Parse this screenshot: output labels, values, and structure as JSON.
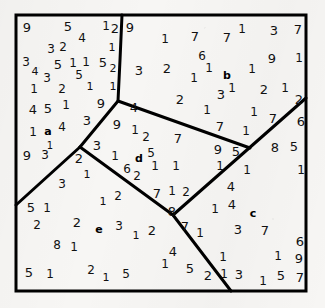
{
  "figure": {
    "width": 325,
    "height": 308,
    "background_color": "#f7f6f4",
    "ink_color": "#111111",
    "border_color": "#000000",
    "border_width": 3,
    "divider_width": 3
  },
  "square": {
    "left": 16,
    "top": 15,
    "right": 306,
    "bottom": 291
  },
  "regions": [
    {
      "id": "a",
      "label": "a",
      "x": 48,
      "y": 131,
      "font_size": 11
    },
    {
      "id": "b",
      "label": "b",
      "x": 227,
      "y": 75,
      "font_size": 11
    },
    {
      "id": "c",
      "label": "c",
      "x": 253,
      "y": 213,
      "font_size": 11
    },
    {
      "id": "d",
      "label": "d",
      "x": 139,
      "y": 158,
      "font_size": 11
    },
    {
      "id": "e",
      "label": "e",
      "x": 99,
      "y": 229,
      "font_size": 11
    }
  ],
  "dividers": [
    {
      "name": "divider-a-b",
      "points": "122,15 120,60 118,101 80,147"
    },
    {
      "name": "divider-a-e",
      "points": "80,147 16,205"
    },
    {
      "name": "divider-d-e",
      "points": "80,147 173,215 231,291"
    },
    {
      "name": "divider-b-d",
      "points": "118,101 250,148"
    },
    {
      "name": "divider-c-left",
      "points": "173,215 306,98"
    }
  ],
  "digits": [
    {
      "v": "9",
      "x": 27,
      "y": 27,
      "s": 13
    },
    {
      "v": "5",
      "x": 68,
      "y": 26,
      "s": 13
    },
    {
      "v": "4",
      "x": 82,
      "y": 38,
      "s": 12
    },
    {
      "v": "1",
      "x": 106,
      "y": 26,
      "s": 12
    },
    {
      "v": "2",
      "x": 115,
      "y": 28,
      "s": 13
    },
    {
      "v": "3",
      "x": 51,
      "y": 49,
      "s": 12
    },
    {
      "v": "2",
      "x": 63,
      "y": 47,
      "s": 12
    },
    {
      "v": "1",
      "x": 112,
      "y": 47,
      "s": 11
    },
    {
      "v": "3",
      "x": 26,
      "y": 62,
      "s": 12
    },
    {
      "v": "4",
      "x": 35,
      "y": 71,
      "s": 11
    },
    {
      "v": "5",
      "x": 58,
      "y": 64,
      "s": 13
    },
    {
      "v": "1",
      "x": 73,
      "y": 63,
      "s": 12
    },
    {
      "v": "1",
      "x": 86,
      "y": 62,
      "s": 12
    },
    {
      "v": "5",
      "x": 103,
      "y": 62,
      "s": 13
    },
    {
      "v": "2",
      "x": 113,
      "y": 68,
      "s": 11
    },
    {
      "v": "3",
      "x": 47,
      "y": 78,
      "s": 12
    },
    {
      "v": "5",
      "x": 79,
      "y": 75,
      "s": 12
    },
    {
      "v": "1",
      "x": 34,
      "y": 89,
      "s": 12
    },
    {
      "v": "2",
      "x": 62,
      "y": 89,
      "s": 12
    },
    {
      "v": "1",
      "x": 90,
      "y": 86,
      "s": 11
    },
    {
      "v": "1",
      "x": 113,
      "y": 86,
      "s": 11
    },
    {
      "v": "4",
      "x": 33,
      "y": 109,
      "s": 13
    },
    {
      "v": "5",
      "x": 48,
      "y": 108,
      "s": 13
    },
    {
      "v": "1",
      "x": 66,
      "y": 105,
      "s": 12
    },
    {
      "v": "9",
      "x": 101,
      "y": 103,
      "s": 13
    },
    {
      "v": "4",
      "x": 62,
      "y": 127,
      "s": 12
    },
    {
      "v": "3",
      "x": 87,
      "y": 120,
      "s": 13
    },
    {
      "v": "1",
      "x": 33,
      "y": 132,
      "s": 12
    },
    {
      "v": "1",
      "x": 50,
      "y": 146,
      "s": 10
    },
    {
      "v": "9",
      "x": 27,
      "y": 155,
      "s": 13
    },
    {
      "v": "3",
      "x": 45,
      "y": 155,
      "s": 12
    },
    {
      "v": "3",
      "x": 62,
      "y": 184,
      "s": 12
    },
    {
      "v": "5",
      "x": 31,
      "y": 207,
      "s": 13
    },
    {
      "v": "1",
      "x": 47,
      "y": 208,
      "s": 12
    },
    {
      "v": "2",
      "x": 37,
      "y": 225,
      "s": 12
    },
    {
      "v": "2",
      "x": 77,
      "y": 222,
      "s": 13
    },
    {
      "v": "3",
      "x": 119,
      "y": 226,
      "s": 12
    },
    {
      "v": "1",
      "x": 136,
      "y": 235,
      "s": 11
    },
    {
      "v": "8",
      "x": 57,
      "y": 245,
      "s": 12
    },
    {
      "v": "1",
      "x": 74,
      "y": 247,
      "s": 12
    },
    {
      "v": "5",
      "x": 29,
      "y": 272,
      "s": 13
    },
    {
      "v": "1",
      "x": 50,
      "y": 274,
      "s": 12
    },
    {
      "v": "2",
      "x": 91,
      "y": 270,
      "s": 12
    },
    {
      "v": "1",
      "x": 106,
      "y": 277,
      "s": 11
    },
    {
      "v": "5",
      "x": 126,
      "y": 274,
      "s": 12
    },
    {
      "v": "1",
      "x": 103,
      "y": 201,
      "s": 11
    },
    {
      "v": "2",
      "x": 118,
      "y": 196,
      "s": 12
    },
    {
      "v": "1",
      "x": 87,
      "y": 174,
      "s": 11
    },
    {
      "v": "2",
      "x": 79,
      "y": 158,
      "s": 13
    },
    {
      "v": "3",
      "x": 97,
      "y": 145,
      "s": 13
    },
    {
      "v": "9",
      "x": 117,
      "y": 124,
      "s": 13
    },
    {
      "v": "1",
      "x": 135,
      "y": 130,
      "s": 12
    },
    {
      "v": "2",
      "x": 146,
      "y": 137,
      "s": 12
    },
    {
      "v": "7",
      "x": 178,
      "y": 138,
      "s": 13
    },
    {
      "v": "1",
      "x": 115,
      "y": 156,
      "s": 12
    },
    {
      "v": "5",
      "x": 151,
      "y": 153,
      "s": 12
    },
    {
      "v": "6",
      "x": 127,
      "y": 169,
      "s": 12
    },
    {
      "v": "2",
      "x": 137,
      "y": 176,
      "s": 12
    },
    {
      "v": "1",
      "x": 155,
      "y": 166,
      "s": 12
    },
    {
      "v": "1",
      "x": 176,
      "y": 166,
      "s": 12
    },
    {
      "v": "7",
      "x": 157,
      "y": 193,
      "s": 13
    },
    {
      "v": "1",
      "x": 172,
      "y": 191,
      "s": 12
    },
    {
      "v": "2",
      "x": 186,
      "y": 192,
      "s": 12
    },
    {
      "v": "8",
      "x": 172,
      "y": 211,
      "s": 13
    },
    {
      "v": "4",
      "x": 134,
      "y": 107,
      "s": 13
    },
    {
      "v": "9",
      "x": 130,
      "y": 27,
      "s": 13
    },
    {
      "v": "1",
      "x": 165,
      "y": 39,
      "s": 12
    },
    {
      "v": "7",
      "x": 195,
      "y": 36,
      "s": 13
    },
    {
      "v": "7",
      "x": 227,
      "y": 37,
      "s": 13
    },
    {
      "v": "1",
      "x": 242,
      "y": 29,
      "s": 12
    },
    {
      "v": "3",
      "x": 274,
      "y": 30,
      "s": 13
    },
    {
      "v": "7",
      "x": 298,
      "y": 29,
      "s": 13
    },
    {
      "v": "6",
      "x": 202,
      "y": 56,
      "s": 12
    },
    {
      "v": "9",
      "x": 272,
      "y": 58,
      "s": 13
    },
    {
      "v": "1",
      "x": 299,
      "y": 58,
      "s": 12
    },
    {
      "v": "3",
      "x": 139,
      "y": 70,
      "s": 13
    },
    {
      "v": "2",
      "x": 167,
      "y": 68,
      "s": 13
    },
    {
      "v": "1",
      "x": 209,
      "y": 68,
      "s": 12
    },
    {
      "v": "1",
      "x": 252,
      "y": 69,
      "s": 12
    },
    {
      "v": "1",
      "x": 194,
      "y": 78,
      "s": 12
    },
    {
      "v": "2",
      "x": 180,
      "y": 99,
      "s": 13
    },
    {
      "v": "3",
      "x": 221,
      "y": 94,
      "s": 13
    },
    {
      "v": "1",
      "x": 232,
      "y": 88,
      "s": 12
    },
    {
      "v": "2",
      "x": 264,
      "y": 89,
      "s": 13
    },
    {
      "v": "1",
      "x": 285,
      "y": 88,
      "s": 12
    },
    {
      "v": "1",
      "x": 207,
      "y": 110,
      "s": 12
    },
    {
      "v": "1",
      "x": 254,
      "y": 112,
      "s": 12
    },
    {
      "v": "2",
      "x": 299,
      "y": 99,
      "s": 13
    },
    {
      "v": "7",
      "x": 273,
      "y": 118,
      "s": 13
    },
    {
      "v": "7",
      "x": 220,
      "y": 126,
      "s": 13
    },
    {
      "v": "1",
      "x": 246,
      "y": 131,
      "s": 12
    },
    {
      "v": "6",
      "x": 301,
      "y": 121,
      "s": 13
    },
    {
      "v": "9",
      "x": 218,
      "y": 149,
      "s": 13
    },
    {
      "v": "5",
      "x": 236,
      "y": 151,
      "s": 13
    },
    {
      "v": "8",
      "x": 275,
      "y": 147,
      "s": 13
    },
    {
      "v": "5",
      "x": 294,
      "y": 146,
      "s": 13
    },
    {
      "v": "1",
      "x": 220,
      "y": 166,
      "s": 12
    },
    {
      "v": "1",
      "x": 247,
      "y": 170,
      "s": 12
    },
    {
      "v": "1",
      "x": 301,
      "y": 170,
      "s": 12
    },
    {
      "v": "4",
      "x": 231,
      "y": 186,
      "s": 13
    },
    {
      "v": "1",
      "x": 215,
      "y": 209,
      "s": 12
    },
    {
      "v": "4",
      "x": 232,
      "y": 204,
      "s": 13
    },
    {
      "v": "7",
      "x": 185,
      "y": 226,
      "s": 13
    },
    {
      "v": "1",
      "x": 200,
      "y": 233,
      "s": 12
    },
    {
      "v": "3",
      "x": 238,
      "y": 229,
      "s": 13
    },
    {
      "v": "7",
      "x": 265,
      "y": 230,
      "s": 13
    },
    {
      "v": "2",
      "x": 152,
      "y": 230,
      "s": 13
    },
    {
      "v": "4",
      "x": 173,
      "y": 251,
      "s": 13
    },
    {
      "v": "1",
      "x": 165,
      "y": 264,
      "s": 12
    },
    {
      "v": "5",
      "x": 190,
      "y": 268,
      "s": 13
    },
    {
      "v": "2",
      "x": 208,
      "y": 275,
      "s": 13
    },
    {
      "v": "1",
      "x": 223,
      "y": 257,
      "s": 12
    },
    {
      "v": "1",
      "x": 224,
      "y": 274,
      "s": 12
    },
    {
      "v": "3",
      "x": 239,
      "y": 274,
      "s": 13
    },
    {
      "v": "6",
      "x": 300,
      "y": 241,
      "s": 13
    },
    {
      "v": "1",
      "x": 278,
      "y": 256,
      "s": 12
    },
    {
      "v": "9",
      "x": 299,
      "y": 258,
      "s": 13
    },
    {
      "v": "5",
      "x": 281,
      "y": 275,
      "s": 13
    },
    {
      "v": "7",
      "x": 300,
      "y": 277,
      "s": 13
    },
    {
      "v": "1",
      "x": 263,
      "y": 281,
      "s": 12
    }
  ]
}
